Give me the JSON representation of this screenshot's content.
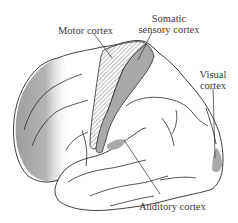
{
  "diagram": {
    "type": "brain-lateral-view",
    "labels": {
      "motor": "Motor cortex",
      "somatic_line1": "Somatic",
      "somatic_line2": "sensory cortex",
      "visual_line1": "Visual",
      "visual_line2": "cortex",
      "auditory": "Auditory cortex"
    },
    "colors": {
      "outline": "#2a2a2a",
      "shaded_region": "#a9a9a9",
      "hatch": "#8a8a8a",
      "background": "#ffffff"
    }
  }
}
